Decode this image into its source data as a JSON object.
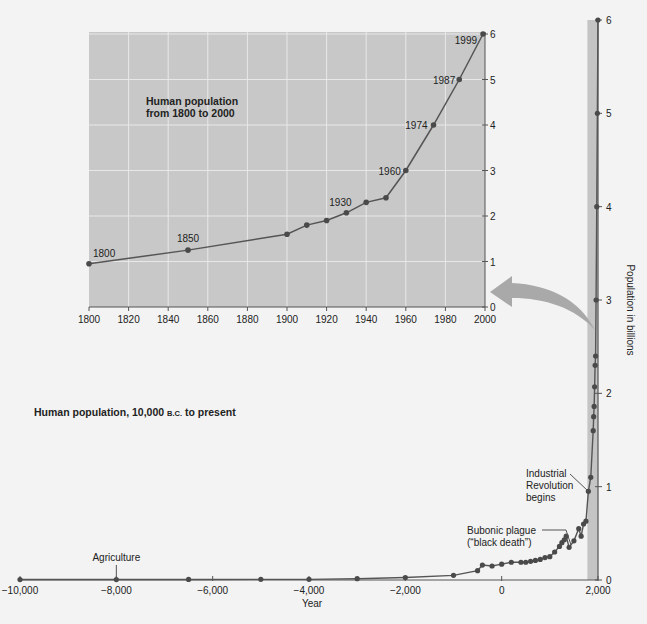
{
  "chart_data": [
    {
      "id": "main",
      "type": "line",
      "title": "Human population, 10,000 B.C. to present",
      "title_main": "Human population, 10,000 ",
      "title_smallcaps": "B.C.",
      "title_tail": " to present",
      "xlabel": "Year",
      "ylabel": "Population in billions",
      "xlim": [
        -10000,
        2000
      ],
      "ylim": [
        0,
        6
      ],
      "x_ticks": [
        -10000,
        -8000,
        -6000,
        -4000,
        -2000,
        0,
        2000
      ],
      "x_tick_labels": [
        "−10,000",
        "−8,000",
        "−6,000",
        "−4,000",
        "−2,000",
        "0",
        "2,000"
      ],
      "y_ticks": [
        0,
        1,
        2,
        3,
        4,
        5,
        6
      ],
      "y_tick_labels": [
        "0",
        "1",
        "2",
        "3",
        "4",
        "5",
        "6"
      ],
      "grid": false,
      "x": [
        -10000,
        -8000,
        -6500,
        -5000,
        -4000,
        -3000,
        -2000,
        -1000,
        -500,
        -400,
        -200,
        0,
        200,
        400,
        500,
        600,
        700,
        800,
        900,
        1000,
        1100,
        1200,
        1250,
        1300,
        1340,
        1400,
        1500,
        1600,
        1650,
        1700,
        1750,
        1800,
        1850,
        1900,
        1910,
        1920,
        1930,
        1940,
        1950,
        1960,
        1974,
        1987,
        1999
      ],
      "values": [
        0.005,
        0.005,
        0.006,
        0.007,
        0.007,
        0.014,
        0.027,
        0.05,
        0.1,
        0.16,
        0.15,
        0.17,
        0.19,
        0.19,
        0.19,
        0.2,
        0.21,
        0.22,
        0.24,
        0.25,
        0.3,
        0.36,
        0.4,
        0.43,
        0.47,
        0.35,
        0.42,
        0.55,
        0.47,
        0.6,
        0.63,
        0.95,
        1.1,
        1.6,
        1.75,
        1.86,
        2.07,
        2.3,
        2.4,
        3.0,
        4.0,
        5.0,
        6.0
      ],
      "annotations": [
        {
          "text": "Agriculture",
          "x": -8000,
          "y": 0.005
        },
        {
          "text": "Bubonic plague",
          "text2": "(“black death”)",
          "x": 1340,
          "y": 0.47
        },
        {
          "text": "Industrial",
          "text2": "Revolution",
          "text3": "begins",
          "x": 1800,
          "y": 0.95
        }
      ]
    },
    {
      "id": "inset",
      "type": "line",
      "title": "Human population from 1800 to 2000",
      "title_line1": "Human population",
      "title_line2": "from 1800 to 2000",
      "xlim": [
        1800,
        2000
      ],
      "ylim": [
        0,
        6
      ],
      "x_ticks": [
        1800,
        1820,
        1840,
        1860,
        1880,
        1900,
        1920,
        1940,
        1960,
        1980,
        2000
      ],
      "x_tick_labels": [
        "1800",
        "1820",
        "1840",
        "1860",
        "1880",
        "1900",
        "1920",
        "1940",
        "1960",
        "1980",
        "2000"
      ],
      "y_ticks": [
        0,
        1,
        2,
        3,
        4,
        5,
        6
      ],
      "y_tick_labels": [
        "0",
        "1",
        "2",
        "3",
        "4",
        "5",
        "6"
      ],
      "grid": true,
      "x": [
        1800,
        1850,
        1900,
        1910,
        1920,
        1930,
        1940,
        1950,
        1960,
        1974,
        1987,
        1999
      ],
      "values": [
        0.95,
        1.25,
        1.6,
        1.8,
        1.9,
        2.07,
        2.3,
        2.4,
        3.0,
        4.0,
        5.0,
        6.0
      ],
      "point_labels": [
        {
          "x": 1800,
          "text": "1800"
        },
        {
          "x": 1850,
          "text": "1850"
        },
        {
          "x": 1930,
          "text": "1930"
        },
        {
          "x": 1960,
          "text": "1960"
        },
        {
          "x": 1974,
          "text": "1974"
        },
        {
          "x": 1987,
          "text": "1987"
        },
        {
          "x": 1999,
          "text": "1999"
        }
      ]
    }
  ],
  "colors": {
    "background": "#f3f3f3",
    "inset_fill": "#c8c8c8",
    "grid": "#e8e8e8",
    "line": "#555555",
    "marker": "#4a4a4a",
    "band": "#c4c4c4",
    "arrow": "#a9a9a9",
    "text": "#222222"
  }
}
